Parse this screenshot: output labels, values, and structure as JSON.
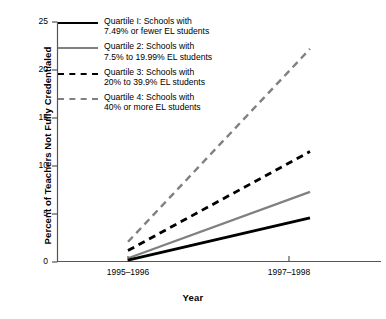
{
  "chart_data": {
    "type": "line",
    "title": "",
    "xlabel": "Year",
    "ylabel": "Percent of Teachers Not Fully Credentialed",
    "x": [
      "1995–1996",
      "1997–1998"
    ],
    "xticklabels": [
      "1995–1996",
      "1997–1998"
    ],
    "yticklabels": [
      "0",
      "5",
      "10",
      "15",
      "20",
      "25"
    ],
    "yticks": [
      0,
      5,
      10,
      15,
      20,
      25
    ],
    "ylim": [
      0,
      25
    ],
    "grid": false,
    "legend_position": "upper left inside",
    "series": [
      {
        "name": "Quartile I: Schools with 7.49% or fewer EL students",
        "values": [
          0.2,
          4.6
        ],
        "color": "#000000",
        "style": "solid"
      },
      {
        "name": "Quartile 2: Schools with 7.5% to 19.99% EL students",
        "values": [
          0.4,
          7.3
        ],
        "color": "#808080",
        "style": "solid"
      },
      {
        "name": "Quartile 3: Schools with 20% to 39.9% EL students",
        "values": [
          1.2,
          11.5
        ],
        "color": "#000000",
        "style": "dashed"
      },
      {
        "name": "Quartile 4: Schools with 40% or more EL students",
        "values": [
          2.1,
          22.2
        ],
        "color": "#808080",
        "style": "dashed"
      }
    ]
  },
  "axis": {
    "ylabel": "Percent of Teachers Not Fully Credentialed",
    "xlabel": "Year",
    "ytick_labels": [
      "25",
      "20",
      "15",
      "10",
      "5",
      "0"
    ],
    "xtick_labels": [
      "1995–1996",
      "1997–1998"
    ]
  },
  "legend": {
    "items": [
      {
        "swatch": "solid-black-line",
        "line1": "Quartile I: Schools with",
        "line2": "7.49% or fewer EL students",
        "text": "Quartile I: Schools with\n7.49% or fewer EL students"
      },
      {
        "swatch": "solid-gray-line",
        "line1": "Quartile 2: Schools with",
        "line2": "7.5% to 19.99% EL students",
        "text": "Quartile 2: Schools with\n7.5% to 19.99% EL students"
      },
      {
        "swatch": "dashed-black-line",
        "line1": "Quartile 3: Schools with",
        "line2": "20% to 39.9% EL students",
        "text": "Quartile 3: Schools with\n20% to 39.9% EL students"
      },
      {
        "swatch": "dashed-gray-line",
        "line1": "Quartile 4: Schools with",
        "line2": "40% or more EL students",
        "text": "Quartile 4: Schools with\n40% or more EL students"
      }
    ]
  },
  "colors": {
    "black": "#000000",
    "gray": "#808080",
    "axis": "#555555",
    "background": "#ffffff"
  }
}
